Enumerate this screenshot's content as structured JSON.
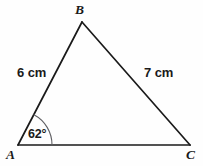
{
  "figure": {
    "kind": "triangle-diagram",
    "background_color": "#fefefe",
    "stroke_color": "#1a1a1a",
    "arc_color": "#5f5f63",
    "width": 203,
    "height": 166
  },
  "vertices": {
    "a": {
      "label": "A",
      "x": 18,
      "y": 145
    },
    "b": {
      "label": "B",
      "x": 82,
      "y": 22
    },
    "c": {
      "label": "C",
      "x": 190,
      "y": 145
    }
  },
  "sides": {
    "ab": {
      "label": "6 cm",
      "length": 6,
      "unit": "cm"
    },
    "bc": {
      "label": "7 cm",
      "length": 7,
      "unit": "cm"
    },
    "ac": {
      "label": "",
      "length": null,
      "unit": ""
    }
  },
  "angles": {
    "a": {
      "label": "62°",
      "value": 62,
      "unit": "degrees"
    }
  }
}
